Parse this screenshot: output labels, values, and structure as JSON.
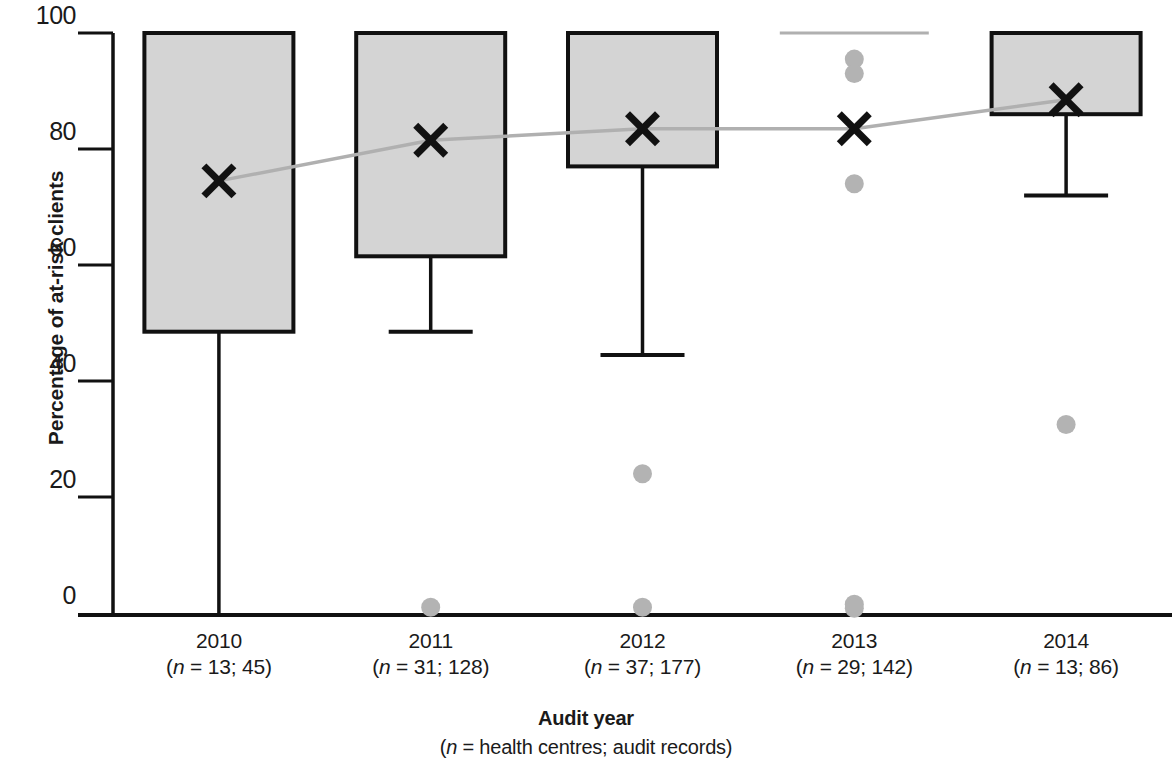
{
  "chart_data": {
    "type": "box",
    "title": "",
    "xlabel": "Audit year",
    "xlabel_sub": "(n = health centres; audit records)",
    "ylabel": "Percentage of at-risk clients",
    "ylim": [
      0,
      100
    ],
    "yticks": [
      0,
      20,
      40,
      60,
      80,
      100
    ],
    "ytick_labels": [
      "0",
      "20",
      "40",
      "60",
      "80",
      "100"
    ],
    "grid": false,
    "legend": null,
    "categories": [
      "2010",
      "2011",
      "2012",
      "2013",
      "2014"
    ],
    "category_sublabels": [
      "(n = 13; 45)",
      "(n = 31; 128)",
      "(n = 37; 177)",
      "(n = 29; 142)",
      "(n = 13; 86)"
    ],
    "n_health_centres": [
      13,
      31,
      37,
      29,
      13
    ],
    "n_audit_records": [
      45,
      128,
      177,
      142,
      86
    ],
    "boxes": [
      {
        "category": "2010",
        "q1": 48.5,
        "q3": 100,
        "median": 100,
        "whisker_low": 0,
        "whisker_high": 100,
        "mean": 74.5,
        "outliers": []
      },
      {
        "category": "2011",
        "q1": 61.5,
        "q3": 100,
        "median": 100,
        "whisker_low": 48.5,
        "whisker_high": 100,
        "mean": 81.5,
        "outliers": [
          1.0
        ]
      },
      {
        "category": "2012",
        "q1": 77.0,
        "q3": 100,
        "median": 100,
        "whisker_low": 44.5,
        "whisker_high": 100,
        "mean": 83.5,
        "outliers": [
          24.0,
          1.0
        ]
      },
      {
        "category": "2013",
        "q1": 100,
        "q3": 100,
        "median": 100,
        "whisker_low": 100,
        "whisker_high": 100,
        "mean": 83.5,
        "outliers": [
          95.5,
          93.0,
          74.0,
          1.5,
          0.8
        ]
      },
      {
        "category": "2014",
        "q1": 86.0,
        "q3": 100,
        "median": 100,
        "whisker_low": 72.0,
        "whisker_high": 100,
        "mean": 88.5,
        "outliers": [
          32.5
        ]
      }
    ],
    "mean_trend": {
      "name": "mean",
      "values": [
        74.5,
        81.5,
        83.5,
        83.5,
        88.5
      ]
    },
    "colors": {
      "box_fill": "#d4d4d4",
      "box_edge": "#111111",
      "whisker": "#111111",
      "mean_marker": "#111111",
      "trend_line": "#b0b0b0",
      "outlier": "#b3b3b3",
      "axis": "#111111",
      "text": "#1a1a1a"
    }
  }
}
